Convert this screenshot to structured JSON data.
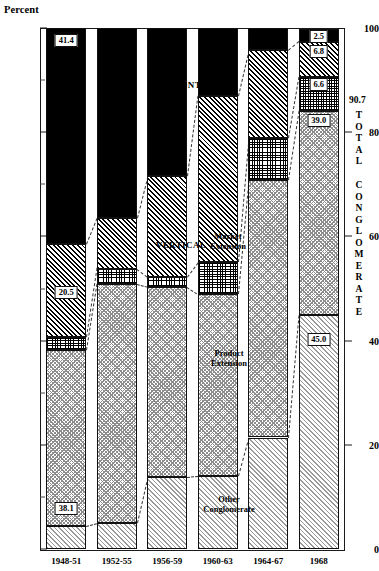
{
  "axes": {
    "y_title": "Percent",
    "y_ticks_major": [
      0,
      20,
      40,
      60,
      80,
      100
    ],
    "y_ticks_minor": [
      10,
      30,
      50,
      70,
      90
    ],
    "y_min": 0,
    "y_max": 100,
    "x_categories": [
      "1948-51",
      "1952-55",
      "1956-59",
      "1960-63",
      "1964-67",
      "1968"
    ]
  },
  "annotations": {
    "horizontal": "HORIZONTAL",
    "vertical": "VERTICAL",
    "market_extension_l1": "Market",
    "market_extension_l2": "Extension",
    "product_extension_l1": "Product",
    "product_extension_l2": "Extension",
    "other_conglomerate_l1": "Other",
    "other_conglomerate_l2": "Conglomerate"
  },
  "right_label": {
    "total_value": "90.7",
    "total_word_1": "TOTAL",
    "total_word_2": "CONGLOMERATE"
  },
  "value_labels": {
    "b1_product": "38.1",
    "b1_vertical": "20.5",
    "b1_horizontal": "41.4",
    "b6_other": "45.0",
    "b6_product": "39.0",
    "b6_market": "6.6",
    "b6_vertical": "6.8",
    "b6_horizontal": "2.5"
  },
  "chart_data": {
    "type": "bar",
    "title": "",
    "subtitle": "",
    "xlabel": "",
    "ylabel": "Percent",
    "ylim": [
      0,
      100
    ],
    "grid": false,
    "legend": "in-plot annotations",
    "stacked": true,
    "stacked_percent": true,
    "categories": [
      "1948-51",
      "1952-55",
      "1956-59",
      "1960-63",
      "1964-67",
      "1968"
    ],
    "series": [
      {
        "name": "Other Conglomerate",
        "pattern": "light-diagonal-hatch",
        "values": [
          4.5,
          5.0,
          13.8,
          14.0,
          21.4,
          45.0
        ],
        "labels": [
          "",
          "",
          "",
          "",
          "",
          "45.0"
        ]
      },
      {
        "name": "Product Extension",
        "pattern": "gray-crosshatch",
        "values": [
          33.6,
          45.8,
          36.5,
          35.0,
          49.4,
          39.0
        ],
        "labels": [
          "38.1",
          "",
          "",
          "",
          "",
          "39.0"
        ]
      },
      {
        "name": "Market Extension",
        "pattern": "fine-grid",
        "values": [
          2.5,
          3.0,
          2.0,
          6.0,
          8.0,
          6.6
        ],
        "labels": [
          "",
          "",
          "",
          "",
          "",
          "6.6"
        ]
      },
      {
        "name": "Vertical",
        "pattern": "dark-diagonal-hatch",
        "values": [
          18.0,
          9.7,
          19.2,
          32.0,
          16.9,
          6.8
        ],
        "labels": [
          "20.5",
          "",
          "",
          "",
          "",
          "6.8"
        ]
      },
      {
        "name": "Horizontal",
        "pattern": "solid-black",
        "values": [
          41.4,
          36.5,
          28.5,
          13.0,
          4.3,
          2.5
        ],
        "labels": [
          "41.4",
          "",
          "",
          "",
          "",
          "2.5"
        ]
      }
    ],
    "segment_boundaries_percent": [
      [
        4.5,
        38.1,
        40.6,
        58.6,
        100.0
      ],
      [
        5.0,
        50.8,
        53.8,
        63.5,
        100.0
      ],
      [
        13.8,
        50.3,
        52.3,
        71.5,
        100.0
      ],
      [
        14.0,
        49.0,
        55.0,
        87.0,
        100.0
      ],
      [
        21.4,
        70.8,
        78.8,
        95.7,
        100.0
      ],
      [
        45.0,
        84.0,
        90.6,
        97.4,
        99.9
      ]
    ],
    "total_conglomerate_1968": 90.7
  }
}
